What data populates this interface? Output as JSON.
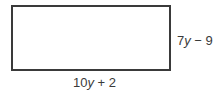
{
  "diagram": {
    "shape": "rectangle",
    "side_label": {
      "coef": "7",
      "var": "y",
      "op": " − ",
      "const": "9"
    },
    "bottom_label": {
      "coef": "10",
      "var": "y",
      "op": " + ",
      "const": "2"
    }
  }
}
